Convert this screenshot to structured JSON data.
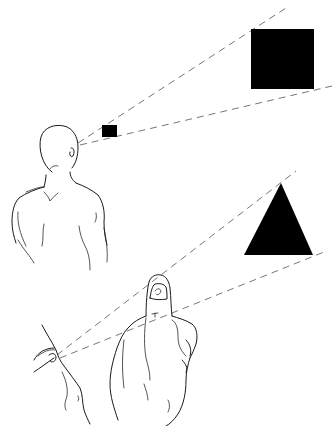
{
  "figure": {
    "colors": {
      "background": "#ffffff",
      "shapes": "#000000",
      "line_art": "#1a1a1a",
      "sight_lines": "#777777"
    },
    "top_scene": {
      "observer": "man-viewed-from-behind",
      "near_object": "small-black-square",
      "far_object": "large-black-square",
      "sight_lines": 2
    },
    "bottom_scene": {
      "observer": "eye-profile-closeup",
      "occluder": "thumb-raised",
      "far_object": "black-triangle",
      "sight_lines": 2
    }
  }
}
